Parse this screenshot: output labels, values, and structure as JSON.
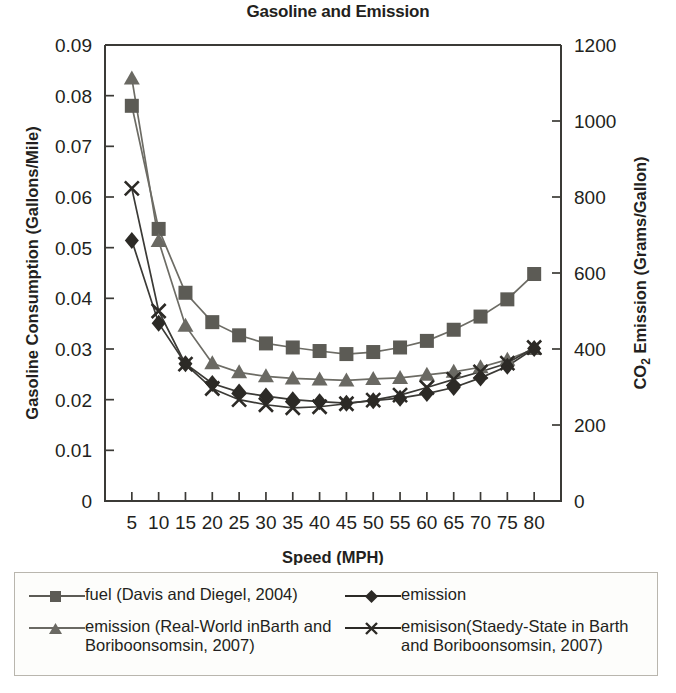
{
  "chart_data": {
    "type": "line",
    "title": "Gasoline and Emission",
    "xlabel": "Speed (MPH)",
    "ylabel": "Gasoline Consumption (Gallons/Mile)",
    "y2label": "CO₂ Emission (Grams/Gallon)",
    "grid": false,
    "legend_position": "below",
    "xlim": [
      0,
      85
    ],
    "ylim": [
      0,
      0.09
    ],
    "y2lim": [
      0,
      1200
    ],
    "xticks": [
      5,
      10,
      15,
      20,
      25,
      30,
      35,
      40,
      45,
      50,
      55,
      60,
      65,
      70,
      75,
      80
    ],
    "xtick_labels": [
      "5",
      "10",
      "15",
      "20",
      "25",
      "30",
      "35",
      "40",
      "45",
      "50",
      "55",
      "60",
      "65",
      "70",
      "75",
      "80"
    ],
    "yticks": [
      0,
      0.01,
      0.02,
      0.03,
      0.04,
      0.05,
      0.06,
      0.07,
      0.08,
      0.09
    ],
    "ytick_labels": [
      "0",
      "0.01",
      "0.02",
      "0.03",
      "0.04",
      "0.05",
      "0.06",
      "0.07",
      "0.08",
      "0.09"
    ],
    "y2ticks": [
      0,
      200,
      400,
      600,
      800,
      1000,
      1200
    ],
    "y2tick_labels": [
      "0",
      "200",
      "400",
      "600",
      "800",
      "1000",
      "1200"
    ],
    "x": [
      5,
      10,
      15,
      20,
      25,
      30,
      35,
      40,
      45,
      50,
      55,
      60,
      65,
      70,
      75,
      80
    ],
    "series": [
      {
        "name": "fuel (Davis and Diegel, 2004)",
        "marker": "square",
        "color": "#5c5b55",
        "line_color": "#6d6c65",
        "axis": "left",
        "values": [
          0.078,
          0.0537,
          0.0411,
          0.0353,
          0.0327,
          0.0311,
          0.0303,
          0.0296,
          0.029,
          0.0294,
          0.0303,
          0.0316,
          0.0338,
          0.0364,
          0.0398,
          0.0448
        ]
      },
      {
        "name": "emission (Real-World inBarth and Boriboonsomsin, 2007)",
        "marker": "triangle",
        "color": "#6a6963",
        "line_color": "#6d6c65",
        "axis": "left",
        "values": [
          0.0834,
          0.0513,
          0.0346,
          0.0272,
          0.0254,
          0.0246,
          0.0242,
          0.024,
          0.0238,
          0.0241,
          0.0243,
          0.0249,
          0.0255,
          0.0264,
          0.0279,
          0.03
        ]
      },
      {
        "name": "emission",
        "marker": "diamond",
        "color": "#2c2a26",
        "line_color": "#3b3a36",
        "axis": "left",
        "values": [
          0.0514,
          0.0351,
          0.0271,
          0.0232,
          0.0215,
          0.0207,
          0.02,
          0.0196,
          0.0193,
          0.0198,
          0.0203,
          0.0212,
          0.0224,
          0.0243,
          0.0266,
          0.0301
        ]
      },
      {
        "name": "emisison(Staedy-State in Barth and Boriboonsomsin, 2007)",
        "marker": "cross",
        "color": "#2c2a26",
        "line_color": "#3b3a36",
        "axis": "left",
        "values": [
          0.0617,
          0.0375,
          0.027,
          0.0222,
          0.02,
          0.019,
          0.0184,
          0.0186,
          0.0192,
          0.0199,
          0.0209,
          0.0224,
          0.024,
          0.0255,
          0.0272,
          0.0303
        ]
      }
    ]
  },
  "legend": {
    "entries": [
      {
        "label": "fuel (Davis and Diegel, 2004)",
        "marker": "square",
        "color": "#5c5b55"
      },
      {
        "label": "emission",
        "marker": "diamond",
        "color": "#2c2a26"
      },
      {
        "label": "emission (Real-World inBarth and Boriboonsomsin, 2007)",
        "marker": "triangle",
        "color": "#6a6963"
      },
      {
        "label": "emisison(Staedy-State in Barth and Boriboonsomsin, 2007)",
        "marker": "cross",
        "color": "#2c2a26"
      }
    ]
  },
  "colors": {
    "axis": "#3b3a36",
    "text": "#231f20",
    "legend_border": "#b9b6ae",
    "background": "#ffffff"
  }
}
